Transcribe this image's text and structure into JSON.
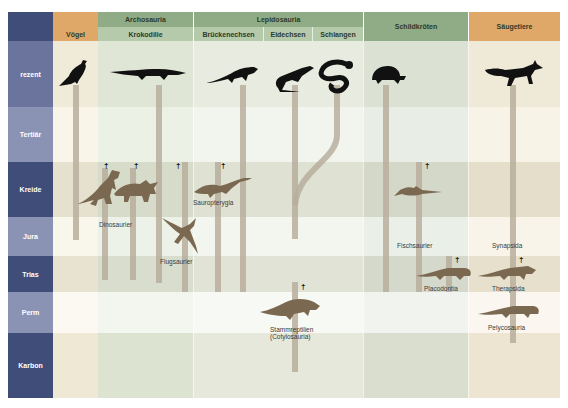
{
  "headers": {
    "groups": [
      {
        "label": "Archosauria"
      },
      {
        "label": "Lepidosauria"
      }
    ],
    "columns": [
      {
        "label": "Vögel"
      },
      {
        "label": "Krokodilie"
      },
      {
        "label": "Brückenechsen"
      },
      {
        "label": "Eidechsen"
      },
      {
        "label": "Schlangen"
      },
      {
        "label": "Schildkröten"
      },
      {
        "label": "Säugetiere"
      }
    ]
  },
  "eras": [
    {
      "label": "rezent"
    },
    {
      "label": "Tertiär"
    },
    {
      "label": "Kreide"
    },
    {
      "label": "Jura"
    },
    {
      "label": "Trias"
    },
    {
      "label": "Perm"
    },
    {
      "label": "Karbon"
    }
  ],
  "extinct_groups": [
    {
      "label": "Dinosaurier"
    },
    {
      "label": "Flugsaurier"
    },
    {
      "label": "Sauropterygia"
    },
    {
      "label": "Fischsaurier"
    },
    {
      "label": "Placodontia"
    },
    {
      "label": "Stammreptilien"
    },
    {
      "label": "(Cotylosauria)"
    },
    {
      "label": "Synapsida"
    },
    {
      "label": "Therapsida"
    },
    {
      "label": "Pelycosauria"
    }
  ],
  "symbols": {
    "extinct": "†"
  },
  "colors": {
    "era_dark": "#3f4d78",
    "era_light": "#8b93b5",
    "orange_header": "#e0a868",
    "green_header_dark": "#8fac86",
    "green_header_light": "#b5c9ab",
    "bar": "#b8ae9c",
    "silhouette_extinct": "#7a6850",
    "silhouette_living": "#111111"
  }
}
